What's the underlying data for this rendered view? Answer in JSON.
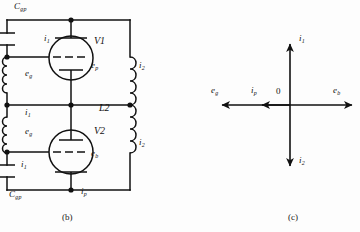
{
  "figure": {
    "title_panels": [
      "(b)",
      "(c)"
    ],
    "background_color": "#fdfdfd",
    "line_color": "#111111"
  },
  "panel_b": {
    "caption": "(b)",
    "components": {
      "capacitor_top": {
        "name": "C",
        "subscript": "gp"
      },
      "capacitor_bottom": {
        "name": "C",
        "subscript": "gp"
      },
      "tube_top": "V1",
      "tube_bottom": "V2",
      "inductor_right": "L2"
    },
    "labels": [
      {
        "sym": "C",
        "sub": "gp",
        "x": 14,
        "y": 3
      },
      {
        "sym": "i",
        "sub": "1",
        "x": 45,
        "y": 36
      },
      {
        "sym": "e",
        "sub": "g",
        "x": 26,
        "y": 72
      },
      {
        "sym": "i",
        "sub": "1",
        "x": 26,
        "y": 110
      },
      {
        "sym": "e",
        "sub": "g",
        "x": 26,
        "y": 130
      },
      {
        "sym": "i",
        "sub": "1",
        "x": 22,
        "y": 162
      },
      {
        "sym": "C",
        "sub": "gp",
        "x": 9,
        "y": 190
      },
      {
        "sym": "e",
        "sub": "p",
        "x": 92,
        "y": 62
      },
      {
        "sym": "e",
        "sub": "b",
        "x": 92,
        "y": 150
      },
      {
        "sym": "i",
        "sub": "2",
        "x": 138,
        "y": 62
      },
      {
        "sym": "i",
        "sub": "2",
        "x": 138,
        "y": 140
      },
      {
        "sym": "i",
        "sub": "p",
        "x": 82,
        "y": 188
      },
      {
        "sym": "L2",
        "sub": "",
        "x": 100,
        "y": 104
      }
    ]
  },
  "panel_c": {
    "caption": "(c)",
    "origin_label": "0",
    "vectors": [
      {
        "name": "i",
        "sub": "1",
        "direction": "up",
        "label_x": 300,
        "label_y": 36
      },
      {
        "name": "i",
        "sub": "2",
        "direction": "down",
        "label_x": 300,
        "label_y": 158
      },
      {
        "name": "e",
        "sub": "g",
        "direction": "left",
        "label_x": 212,
        "label_y": 88
      },
      {
        "name": "i",
        "sub": "p",
        "direction": "left",
        "label_x": 252,
        "label_y": 88
      },
      {
        "name": "e",
        "sub": "b",
        "direction": "right",
        "label_x": 334,
        "label_y": 88
      }
    ]
  }
}
